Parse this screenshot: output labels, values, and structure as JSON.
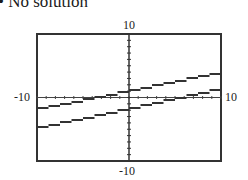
{
  "header": {
    "title": "• No solution"
  },
  "chart_data": {
    "type": "line",
    "title": "No solution",
    "xlabel": "",
    "ylabel": "",
    "xlim": [
      -10,
      10
    ],
    "ylim": [
      -10,
      10
    ],
    "tick_labels": {
      "y_top": "10",
      "y_bottom": "-10",
      "x_left": "-10",
      "x_right": "10"
    },
    "grid": false,
    "legend": null,
    "series": [
      {
        "name": "upper line",
        "x": [
          -10,
          10
        ],
        "y": [
          -1.9,
          3.9
        ],
        "style": "dashed-calculator",
        "color": "#333333"
      },
      {
        "name": "lower line",
        "x": [
          -10,
          10
        ],
        "y": [
          -4.9,
          1.3
        ],
        "style": "dashed-calculator",
        "color": "#333333"
      }
    ],
    "annotations": [
      "Parallel lines - no intersection"
    ],
    "frame": {
      "left": 37,
      "top": 34,
      "right": 221,
      "bottom": 161
    }
  }
}
